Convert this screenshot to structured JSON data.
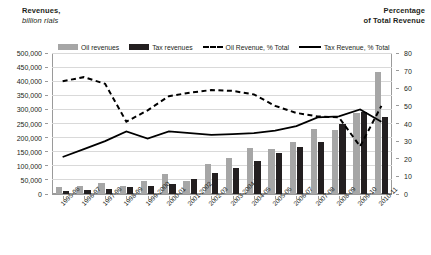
{
  "chart_data": {
    "type": "bar",
    "title": "",
    "categories": [
      "1995-96",
      "1996-97",
      "1997-98",
      "1998-99",
      "1999-2000",
      "2000-01",
      "2001-2002",
      "2002-03",
      "2003-2004",
      "2004-05",
      "2005-06",
      "2006-07",
      "2007-08",
      "2008-09",
      "2009-10",
      "2010-11"
    ],
    "left_axis": {
      "label_line1": "Revenues,",
      "label_line2": "billion rials",
      "ticks": [
        "0",
        "50,000",
        "100,000",
        "150,000",
        "200,000",
        "250,000",
        "300,000",
        "350,000",
        "400,000",
        "450,000",
        "500,000"
      ],
      "min": 0,
      "max": 500000,
      "step": 50000
    },
    "right_axis": {
      "label_line1": "Percentage",
      "label_line2": "of Total Revenue",
      "ticks": [
        "0",
        "10",
        "20",
        "30",
        "40",
        "50",
        "60",
        "70",
        "80"
      ],
      "min": 0,
      "max": 80,
      "step": 10
    },
    "grid": true,
    "legend_position": "top",
    "series": [
      {
        "name": "Oil revenues",
        "kind": "bar",
        "axis": "left",
        "color": "#a6a6a6",
        "values": [
          25000,
          27000,
          38000,
          28000,
          45000,
          72000,
          47000,
          107000,
          126000,
          162000,
          160000,
          183000,
          232000,
          226000,
          287000,
          434000
        ]
      },
      {
        "name": "Tax revenues",
        "kind": "bar",
        "axis": "left",
        "color": "#231f20",
        "values": [
          9000,
          15000,
          18000,
          26000,
          30000,
          36000,
          55000,
          73000,
          92000,
          118000,
          146000,
          166000,
          186000,
          248000,
          290000,
          272000
        ]
      },
      {
        "name": "Oil Revenue, % Total",
        "kind": "line-dashed",
        "axis": "right",
        "color": "#000000",
        "values": [
          64.0,
          66.3,
          62.5,
          41.0,
          47.5,
          55.5,
          57.5,
          59.0,
          58.5,
          56.5,
          50.0,
          46.0,
          44.0,
          43.5,
          27.0,
          50.0
        ]
      },
      {
        "name": "Tax Revenue, % Total",
        "kind": "line-solid",
        "axis": "right",
        "color": "#000000",
        "values": [
          21.0,
          25.5,
          30.0,
          35.5,
          31.5,
          35.5,
          34.5,
          33.5,
          34.0,
          34.5,
          36.0,
          38.5,
          43.5,
          44.0,
          48.0,
          41.0
        ]
      }
    ]
  }
}
